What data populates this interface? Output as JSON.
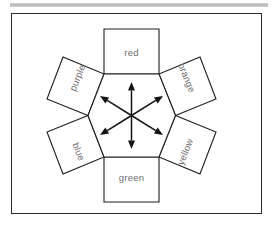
{
  "page": {
    "background_color": "#ffffff",
    "top_rule_color": "#c2c2c2"
  },
  "frame": {
    "border_color": "#2b2b2b",
    "fill_color": "#ffffff"
  },
  "diagram": {
    "type": "hexagon-with-attached-squares",
    "center_shape": "hexagon",
    "center": {
      "x": 131.5,
      "y": 115.5
    },
    "stroke_color": "#1e1e1e",
    "label_color": "#6d6d6d",
    "arrow_color": "#141414",
    "hexagon_vertices": [
      {
        "x": 104,
        "y": 74
      },
      {
        "x": 159,
        "y": 74
      },
      {
        "x": 175.5,
        "y": 115.5
      },
      {
        "x": 159,
        "y": 157
      },
      {
        "x": 104,
        "y": 157
      },
      {
        "x": 88,
        "y": 115.5
      }
    ],
    "faces": [
      {
        "name": "red",
        "label": "red",
        "position": "top",
        "rotation_deg": 0,
        "label_x": 131.5,
        "label_y": 53,
        "points": "104,74 159,74 159,29 104,29"
      },
      {
        "name": "orange",
        "label": "orange",
        "position": "upper-right",
        "rotation_deg": 68,
        "label_x": 186,
        "label_y": 78,
        "points": "159,74 175.5,115.5 216,99 200,57"
      },
      {
        "name": "yellow",
        "label": "yellow",
        "position": "lower-right",
        "rotation_deg": -68,
        "label_x": 186,
        "label_y": 152,
        "points": "175.5,115.5 159,157 200,174 216,132"
      },
      {
        "name": "green",
        "label": "green",
        "position": "bottom",
        "rotation_deg": 0,
        "label_x": 131.5,
        "label_y": 178,
        "points": "104,157 159,157 159,202 104,202"
      },
      {
        "name": "blue",
        "label": "blue",
        "position": "lower-left",
        "rotation_deg": 68,
        "label_x": 78,
        "label_y": 152,
        "points": "88,115.5 104,157 63,174 47,132"
      },
      {
        "name": "purple",
        "label": "purple",
        "position": "upper-left",
        "rotation_deg": -68,
        "label_x": 78,
        "label_y": 78,
        "points": "104,74 88,115.5 47,99 63,57"
      }
    ],
    "arrows": {
      "count": 6,
      "style": "double-headed",
      "origin": {
        "x": 131.5,
        "y": 115.5
      },
      "tips": [
        {
          "name": "arrow-up",
          "x": 131.5,
          "y": 82
        },
        {
          "name": "arrow-upper-right",
          "x": 163,
          "y": 96
        },
        {
          "name": "arrow-lower-right",
          "x": 163,
          "y": 135
        },
        {
          "name": "arrow-down",
          "x": 131.5,
          "y": 149
        },
        {
          "name": "arrow-lower-left",
          "x": 100,
          "y": 135
        },
        {
          "name": "arrow-upper-left",
          "x": 100,
          "y": 96
        }
      ]
    }
  }
}
